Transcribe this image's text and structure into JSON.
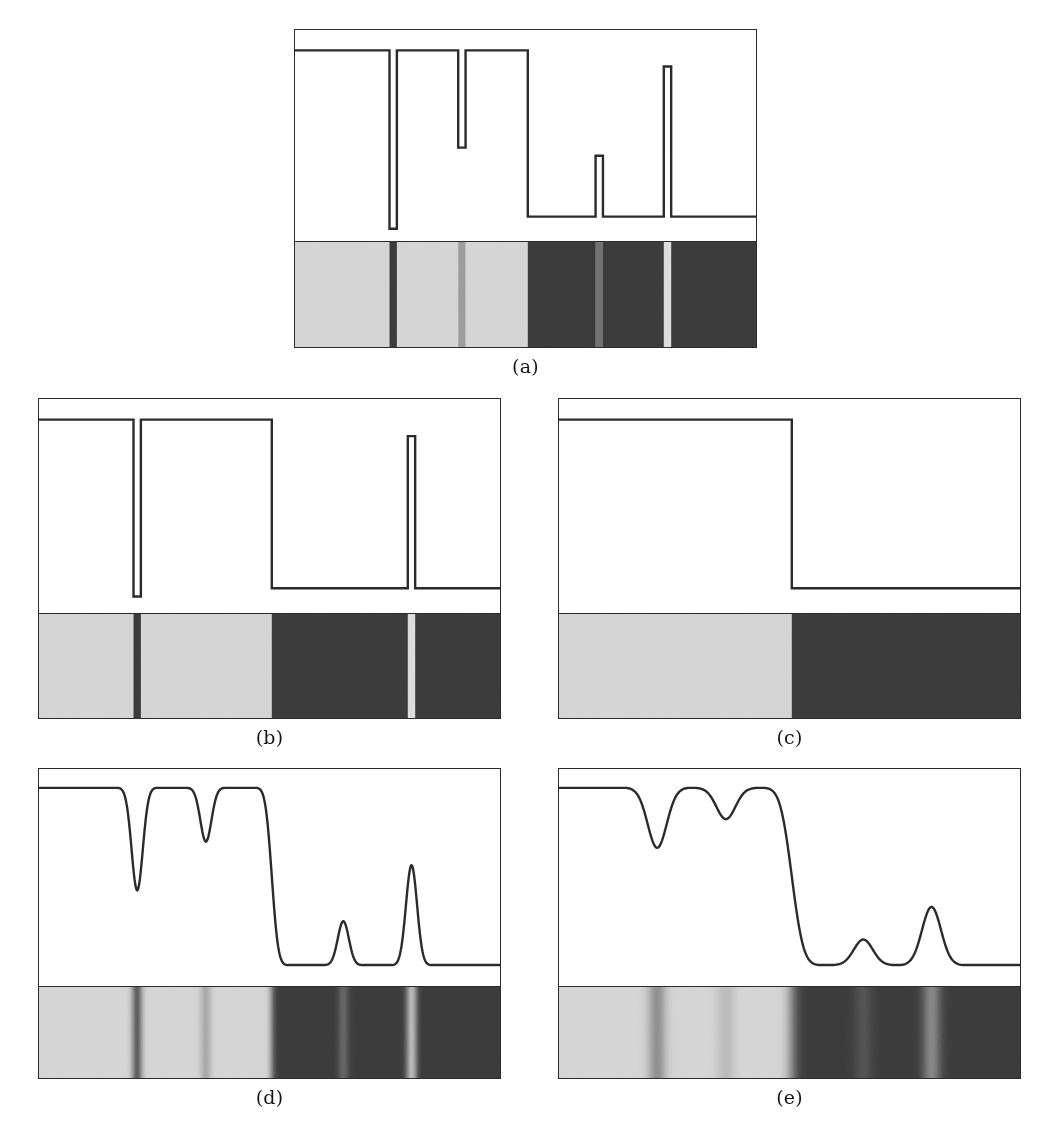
{
  "colors": {
    "stroke": "#2b2b2b",
    "background": "#ffffff",
    "light_gray": "#d4d4d4",
    "mid_gray": "#9a9a9a",
    "dark_gray": "#3a3a3a",
    "bright_line": "#dcdcdc",
    "dark_line": "#3a3a3a",
    "caption_color": "#161616"
  },
  "panels": [
    {
      "id": "a",
      "caption": "(a)",
      "smoothing": "none",
      "chart_data": {
        "type": "line",
        "title": "Original step-edge signal profile",
        "xlabel": "",
        "ylabel": "Intensity",
        "xlim": [
          0,
          100
        ],
        "ylim": [
          0,
          100
        ],
        "grid": false,
        "legend": null,
        "x": [
          0,
          20.5,
          20.5,
          22.1,
          22.1,
          35.4,
          35.4,
          37.0,
          37.0,
          50.5,
          50.5,
          65.2,
          65.2,
          66.8,
          66.8,
          80.0,
          80.0,
          81.6,
          81.6,
          100
        ],
        "y": [
          92,
          92,
          4,
          4,
          92,
          92,
          44,
          44,
          92,
          92,
          10,
          10,
          40,
          40,
          10,
          10,
          84,
          84,
          10,
          10
        ],
        "features": [
          {
            "name": "baseline-high-left",
            "center": 10.0,
            "value": 92,
            "kind": "plateau"
          },
          {
            "name": "deep-narrow-dip",
            "center": 21.3,
            "value": 4,
            "kind": "dip",
            "width": 1.6
          },
          {
            "name": "plateau-high-mid",
            "center": 28.7,
            "value": 92,
            "kind": "plateau"
          },
          {
            "name": "shallow-narrow-dip",
            "center": 36.2,
            "value": 44,
            "kind": "dip",
            "width": 1.6
          },
          {
            "name": "plateau-high-right",
            "center": 43.7,
            "value": 92,
            "kind": "plateau"
          },
          {
            "name": "major-step-down",
            "center": 50.5,
            "value": 10,
            "kind": "step"
          },
          {
            "name": "baseline-low",
            "center": 57.8,
            "value": 10,
            "kind": "plateau"
          },
          {
            "name": "small-narrow-peak",
            "center": 66.0,
            "value": 40,
            "kind": "peak",
            "width": 1.6
          },
          {
            "name": "tall-narrow-peak",
            "center": 80.8,
            "value": 84,
            "kind": "peak",
            "width": 1.6
          },
          {
            "name": "baseline-low-right",
            "center": 90.0,
            "value": 10,
            "kind": "plateau"
          }
        ]
      },
      "band": {
        "edges": "sharp",
        "blur_px": 0,
        "segments": [
          {
            "from": 0.0,
            "to": 20.5,
            "gray": "#d4d4d4"
          },
          {
            "from": 20.5,
            "to": 22.1,
            "gray": "#3a3a3a"
          },
          {
            "from": 22.1,
            "to": 35.4,
            "gray": "#d4d4d4"
          },
          {
            "from": 35.4,
            "to": 37.0,
            "gray": "#9a9a9a"
          },
          {
            "from": 37.0,
            "to": 50.5,
            "gray": "#d4d4d4"
          },
          {
            "from": 50.5,
            "to": 65.2,
            "gray": "#3a3a3a"
          },
          {
            "from": 65.2,
            "to": 66.8,
            "gray": "#6f6f6f"
          },
          {
            "from": 66.8,
            "to": 80.0,
            "gray": "#3a3a3a"
          },
          {
            "from": 80.0,
            "to": 81.6,
            "gray": "#dcdcdc"
          },
          {
            "from": 81.6,
            "to": 100.0,
            "gray": "#3a3a3a"
          }
        ]
      }
    },
    {
      "id": "b",
      "caption": "(b)",
      "smoothing": "coarse",
      "chart_data": {
        "type": "line",
        "title": "Coarser scale: weak features suppressed",
        "xlabel": "",
        "ylabel": "Intensity",
        "xlim": [
          0,
          100
        ],
        "ylim": [
          0,
          100
        ],
        "grid": false,
        "legend": null,
        "x": [
          0,
          20.5,
          20.5,
          22.1,
          22.1,
          50.5,
          50.5,
          80.0,
          80.0,
          81.6,
          81.6,
          100
        ],
        "y": [
          92,
          92,
          6,
          6,
          92,
          92,
          10,
          10,
          84,
          84,
          10,
          10
        ],
        "features": [
          {
            "name": "baseline-high-left",
            "center": 10.0,
            "value": 92,
            "kind": "plateau"
          },
          {
            "name": "deep-narrow-dip",
            "center": 21.3,
            "value": 6,
            "kind": "dip",
            "width": 1.6
          },
          {
            "name": "plateau-high",
            "center": 36.0,
            "value": 92,
            "kind": "plateau"
          },
          {
            "name": "major-step-down",
            "center": 50.5,
            "value": 10,
            "kind": "step"
          },
          {
            "name": "baseline-low",
            "center": 65.0,
            "value": 10,
            "kind": "plateau"
          },
          {
            "name": "tall-narrow-peak",
            "center": 80.8,
            "value": 84,
            "kind": "peak",
            "width": 1.6
          },
          {
            "name": "baseline-low-right",
            "center": 90.0,
            "value": 10,
            "kind": "plateau"
          }
        ]
      },
      "band": {
        "edges": "sharp",
        "blur_px": 0,
        "segments": [
          {
            "from": 0.0,
            "to": 20.5,
            "gray": "#d4d4d4"
          },
          {
            "from": 20.5,
            "to": 22.1,
            "gray": "#3a3a3a"
          },
          {
            "from": 22.1,
            "to": 50.5,
            "gray": "#d4d4d4"
          },
          {
            "from": 50.5,
            "to": 80.0,
            "gray": "#3a3a3a"
          },
          {
            "from": 80.0,
            "to": 81.6,
            "gray": "#dcdcdc"
          },
          {
            "from": 81.6,
            "to": 100.0,
            "gray": "#3a3a3a"
          }
        ]
      }
    },
    {
      "id": "c",
      "caption": "(c)",
      "smoothing": "coarsest",
      "chart_data": {
        "type": "line",
        "title": "Coarsest scale: only the major step survives",
        "xlabel": "",
        "ylabel": "Intensity",
        "xlim": [
          0,
          100
        ],
        "ylim": [
          0,
          100
        ],
        "grid": false,
        "legend": null,
        "x": [
          0,
          50.5,
          50.5,
          100
        ],
        "y": [
          92,
          92,
          10,
          10
        ],
        "features": [
          {
            "name": "baseline-high-left",
            "center": 25.0,
            "value": 92,
            "kind": "plateau"
          },
          {
            "name": "major-step-down",
            "center": 50.5,
            "value": 10,
            "kind": "step"
          },
          {
            "name": "baseline-low-right",
            "center": 75.0,
            "value": 10,
            "kind": "plateau"
          }
        ]
      },
      "band": {
        "edges": "sharp",
        "blur_px": 0,
        "segments": [
          {
            "from": 0.0,
            "to": 50.5,
            "gray": "#d4d4d4"
          },
          {
            "from": 50.5,
            "to": 100.0,
            "gray": "#3a3a3a"
          }
        ]
      }
    },
    {
      "id": "d",
      "caption": "(d)",
      "smoothing": "gaussian-small",
      "chart_data": {
        "type": "line",
        "title": "Gaussian smoothed signal, small sigma",
        "xlabel": "",
        "ylabel": "Intensity",
        "xlim": [
          0,
          100
        ],
        "ylim": [
          0,
          100
        ],
        "grid": false,
        "legend": null,
        "sigma": 1.1,
        "features": [
          {
            "name": "baseline-high-left",
            "center": 10.0,
            "value": 93,
            "kind": "plateau"
          },
          {
            "name": "deep-narrow-dip",
            "center": 21.3,
            "value": 5,
            "kind": "dip",
            "width": 2.4
          },
          {
            "name": "plateau-high-mid",
            "center": 28.7,
            "value": 93,
            "kind": "plateau"
          },
          {
            "name": "shallow-narrow-dip",
            "center": 36.2,
            "value": 46,
            "kind": "dip",
            "width": 2.4
          },
          {
            "name": "plateau-high-right",
            "center": 43.7,
            "value": 93,
            "kind": "plateau"
          },
          {
            "name": "major-step-down",
            "center": 50.5,
            "value": 8,
            "kind": "step"
          },
          {
            "name": "baseline-low",
            "center": 58.0,
            "value": 8,
            "kind": "plateau"
          },
          {
            "name": "small-narrow-peak",
            "center": 66.0,
            "value": 42,
            "kind": "peak",
            "width": 2.4
          },
          {
            "name": "tall-narrow-peak",
            "center": 80.8,
            "value": 90,
            "kind": "peak",
            "width": 2.4
          },
          {
            "name": "baseline-low-right",
            "center": 92.0,
            "value": 8,
            "kind": "plateau"
          }
        ]
      },
      "band": {
        "edges": "soft",
        "blur_px": 3,
        "segments": [
          {
            "from": 0.0,
            "to": 20.5,
            "gray": "#d4d4d4"
          },
          {
            "from": 20.5,
            "to": 22.1,
            "gray": "#3a3a3a"
          },
          {
            "from": 22.1,
            "to": 35.4,
            "gray": "#d4d4d4"
          },
          {
            "from": 35.4,
            "to": 37.0,
            "gray": "#9a9a9a"
          },
          {
            "from": 37.0,
            "to": 50.5,
            "gray": "#d4d4d4"
          },
          {
            "from": 50.5,
            "to": 65.2,
            "gray": "#3a3a3a"
          },
          {
            "from": 65.2,
            "to": 66.8,
            "gray": "#6f6f6f"
          },
          {
            "from": 66.8,
            "to": 80.0,
            "gray": "#3a3a3a"
          },
          {
            "from": 80.0,
            "to": 81.6,
            "gray": "#dcdcdc"
          },
          {
            "from": 81.6,
            "to": 100.0,
            "gray": "#3a3a3a"
          }
        ]
      }
    },
    {
      "id": "e",
      "caption": "(e)",
      "smoothing": "gaussian-large",
      "chart_data": {
        "type": "line",
        "title": "Gaussian smoothed signal, larger sigma",
        "xlabel": "",
        "ylabel": "Intensity",
        "xlim": [
          0,
          100
        ],
        "ylim": [
          0,
          100
        ],
        "grid": false,
        "legend": null,
        "sigma": 2.0,
        "features": [
          {
            "name": "baseline-high-left",
            "center": 10.0,
            "value": 93,
            "kind": "plateau"
          },
          {
            "name": "deep-narrow-dip",
            "center": 21.3,
            "value": 12,
            "kind": "dip",
            "width": 4.2
          },
          {
            "name": "plateau-high-mid",
            "center": 28.7,
            "value": 91,
            "kind": "plateau"
          },
          {
            "name": "shallow-narrow-dip",
            "center": 36.2,
            "value": 56,
            "kind": "dip",
            "width": 4.2
          },
          {
            "name": "plateau-high-right",
            "center": 43.7,
            "value": 92,
            "kind": "plateau"
          },
          {
            "name": "major-step-down",
            "center": 50.5,
            "value": 8,
            "kind": "step"
          },
          {
            "name": "baseline-low",
            "center": 58.0,
            "value": 8,
            "kind": "plateau"
          },
          {
            "name": "small-narrow-peak",
            "center": 66.0,
            "value": 33,
            "kind": "peak",
            "width": 4.2
          },
          {
            "name": "tall-narrow-peak",
            "center": 80.8,
            "value": 76,
            "kind": "peak",
            "width": 4.2
          },
          {
            "name": "baseline-low-right",
            "center": 92.0,
            "value": 8,
            "kind": "plateau"
          }
        ]
      },
      "band": {
        "edges": "very-soft",
        "blur_px": 6,
        "segments": [
          {
            "from": 0.0,
            "to": 20.5,
            "gray": "#d4d4d4"
          },
          {
            "from": 20.5,
            "to": 22.1,
            "gray": "#3a3a3a"
          },
          {
            "from": 22.1,
            "to": 35.4,
            "gray": "#d4d4d4"
          },
          {
            "from": 35.4,
            "to": 37.0,
            "gray": "#9a9a9a"
          },
          {
            "from": 37.0,
            "to": 50.5,
            "gray": "#d4d4d4"
          },
          {
            "from": 50.5,
            "to": 65.2,
            "gray": "#3a3a3a"
          },
          {
            "from": 65.2,
            "to": 66.8,
            "gray": "#6f6f6f"
          },
          {
            "from": 66.8,
            "to": 80.0,
            "gray": "#3a3a3a"
          },
          {
            "from": 80.0,
            "to": 81.6,
            "gray": "#dcdcdc"
          },
          {
            "from": 81.6,
            "to": 100.0,
            "gray": "#3a3a3a"
          }
        ]
      }
    }
  ]
}
